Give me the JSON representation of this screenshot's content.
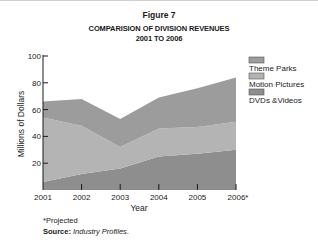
{
  "figure_label": "Figure 7",
  "chart_data": {
    "type": "area",
    "stacked": true,
    "title": "COMPARISION OF DIVISION REVENUES",
    "subtitle": "2001  TO 2006",
    "xlabel": "Year",
    "ylabel": "Millions of Dollars",
    "categories": [
      "2001",
      "2002",
      "2003",
      "2004",
      "2005",
      "2006*"
    ],
    "ylim": [
      0,
      100
    ],
    "yticks": [
      20,
      40,
      60,
      80,
      100
    ],
    "grid": false,
    "legend_position": "right",
    "series": [
      {
        "name": "DVDs &Videos",
        "values": [
          6,
          12,
          16,
          25,
          27,
          30
        ],
        "color": "#8e8e8e"
      },
      {
        "name": "Motion Pictures",
        "values": [
          48,
          36,
          16,
          21,
          20,
          21
        ],
        "color": "#b4b4b4"
      },
      {
        "name": "Theme Parks",
        "values": [
          12,
          20,
          21,
          23,
          29,
          33
        ],
        "color": "#9c9c9c"
      }
    ],
    "legend_order": [
      "Theme Parks",
      "Motion Pictures",
      "DVDs &Videos"
    ]
  },
  "footnote": {
    "projected": "*Projected",
    "source_label": "Source:",
    "source_text": "Industry Profiles",
    "source_end": "."
  }
}
